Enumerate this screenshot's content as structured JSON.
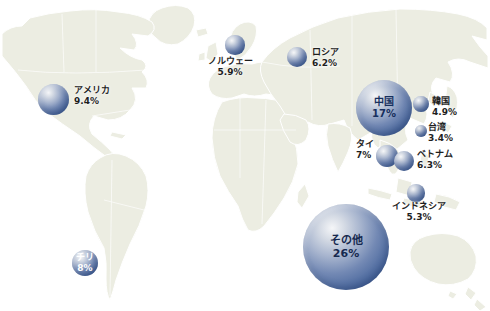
{
  "page": {
    "background": "#ffffff"
  },
  "map": {
    "land_color": "#ecede2",
    "border_color": "#ffffff",
    "ocean_color": "#ffffff"
  },
  "bubble_style": {
    "highlight": "#f5f6f8",
    "mid": "#7389b4",
    "deep": "#2c4a80",
    "outside_label_color": "#1e1e1e"
  },
  "chart_data": {
    "type": "bubble-map",
    "title": "",
    "unit": "%",
    "radius_px_per_percent": 1.65,
    "points": [
      {
        "id": "usa",
        "name": "アメリカ",
        "value": 9.4,
        "value_text": "9.4%",
        "cx": 53,
        "cy": 99,
        "r": 15.5,
        "label": {
          "pos": "outside",
          "x": 74,
          "y": 85,
          "align": "left"
        }
      },
      {
        "id": "chile",
        "name": "チリ",
        "value": 8,
        "value_text": "8%",
        "cx": 85,
        "cy": 263,
        "r": 13.2,
        "label": {
          "pos": "inside",
          "color": "#ffffff",
          "fs": 9
        }
      },
      {
        "id": "norway",
        "name": "ノルウェー",
        "value": 5.9,
        "value_text": "5.9%",
        "cx": 235,
        "cy": 45,
        "r": 9.7,
        "label": {
          "pos": "outside",
          "x": 230,
          "y": 56,
          "align": "center"
        }
      },
      {
        "id": "russia",
        "name": "ロシア",
        "value": 6.2,
        "value_text": "6.2%",
        "cx": 297,
        "cy": 57,
        "r": 10.2,
        "label": {
          "pos": "outside",
          "x": 312,
          "y": 47,
          "align": "left"
        }
      },
      {
        "id": "china",
        "name": "中国",
        "value": 17,
        "value_text": "17%",
        "cx": 384,
        "cy": 108,
        "r": 28,
        "label": {
          "pos": "inside",
          "color": "#17305e",
          "fs": 10
        }
      },
      {
        "id": "korea",
        "name": "韓国",
        "value": 4.9,
        "value_text": "4.9%",
        "cx": 421,
        "cy": 104,
        "r": 7.9,
        "label": {
          "pos": "outside",
          "x": 432,
          "y": 96,
          "align": "left"
        }
      },
      {
        "id": "taiwan",
        "name": "台湾",
        "value": 3.4,
        "value_text": "3.4%",
        "cx": 421,
        "cy": 131,
        "r": 6.0,
        "label": {
          "pos": "outside",
          "x": 428,
          "y": 122,
          "align": "left"
        }
      },
      {
        "id": "thailand",
        "name": "タイ",
        "value": 7,
        "value_text": "7%",
        "cx": 387,
        "cy": 156,
        "r": 11.2,
        "label": {
          "pos": "outside",
          "x": 356,
          "y": 139,
          "align": "left"
        }
      },
      {
        "id": "vietnam",
        "name": "ベトナム",
        "value": 6.3,
        "value_text": "6.3%",
        "cx": 404,
        "cy": 161,
        "r": 10.2,
        "label": {
          "pos": "outside",
          "x": 417,
          "y": 149,
          "align": "left"
        }
      },
      {
        "id": "indonesia",
        "name": "インドネシア",
        "value": 5.3,
        "value_text": "5.3%",
        "cx": 416,
        "cy": 193,
        "r": 8.7,
        "label": {
          "pos": "outside",
          "x": 419,
          "y": 201,
          "align": "center"
        }
      },
      {
        "id": "others",
        "name": "その他",
        "value": 26,
        "value_text": "26%",
        "cx": 346,
        "cy": 247,
        "r": 43,
        "label": {
          "pos": "inside",
          "color": "#16294f",
          "fs": 11
        }
      }
    ]
  }
}
